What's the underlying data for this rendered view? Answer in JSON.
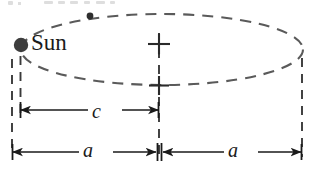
{
  "figure": {
    "type": "diagram",
    "width": 319,
    "height": 175,
    "background_color": "#ffffff",
    "stroke_color": "#4a4a4a",
    "dark_stroke_color": "#1a1a1a",
    "labels": {
      "sun": "Sun",
      "semi_focal_distance": "c",
      "semi_major_left": "a",
      "semi_major_right": "a"
    },
    "markers": {
      "sun_body": "filled-circle",
      "planet_body": "small-filled-circle",
      "center_mark": "plus-sign",
      "bottom_center_mark": "plus-sign"
    },
    "geometry": {
      "ellipse_center_x": 162,
      "ellipse_center_y": 49.5,
      "ellipse_rx": 141,
      "ellipse_ry": 35.5,
      "sun_x": 20,
      "sun_y": 45,
      "planet_x": 90,
      "planet_y": 15,
      "center_x": 158,
      "left_edge_x": 12,
      "right_edge_x": 302
    },
    "dimension_lines": [
      {
        "name": "c",
        "from_x": 20,
        "to_x": 158,
        "y": 110
      },
      {
        "name": "a-left",
        "from_x": 12,
        "to_x": 158,
        "y": 152
      },
      {
        "name": "a-right",
        "from_x": 162,
        "to_x": 302,
        "y": 152
      }
    ],
    "partial_top_text": ""
  }
}
